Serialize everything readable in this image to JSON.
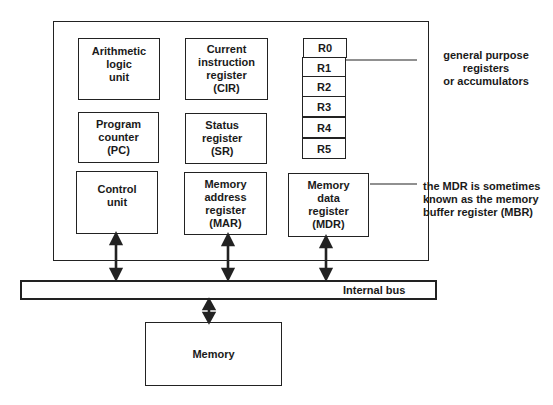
{
  "diagram": {
    "cpu_components": [
      {
        "id": "alu",
        "label": "Arithmetic\nlogic\nunit"
      },
      {
        "id": "cir",
        "label": "Current\ninstruction\nregister\n(CIR)"
      },
      {
        "id": "pc",
        "label": "Program\ncounter\n(PC)"
      },
      {
        "id": "sr",
        "label": "Status\nregister\n(SR)"
      },
      {
        "id": "cu",
        "label": "Control\nunit"
      },
      {
        "id": "mar",
        "label": "Memory\naddress\nregister\n(MAR)"
      },
      {
        "id": "mdr",
        "label": "Memory\ndata\nregister\n(MDR)"
      }
    ],
    "registers": [
      "R0",
      "R1",
      "R2",
      "R3",
      "R4",
      "R5"
    ],
    "annotations": {
      "gpr": "general purpose registers\nor accumulators",
      "mdr_line1": "the MDR is sometimes",
      "mdr_line2_prefix": "known as the ",
      "mdr_line2_bold": "memory",
      "mdr_line3": "buffer register (MBR)"
    },
    "bus_label": "Internal bus",
    "memory_label": "Memory"
  }
}
